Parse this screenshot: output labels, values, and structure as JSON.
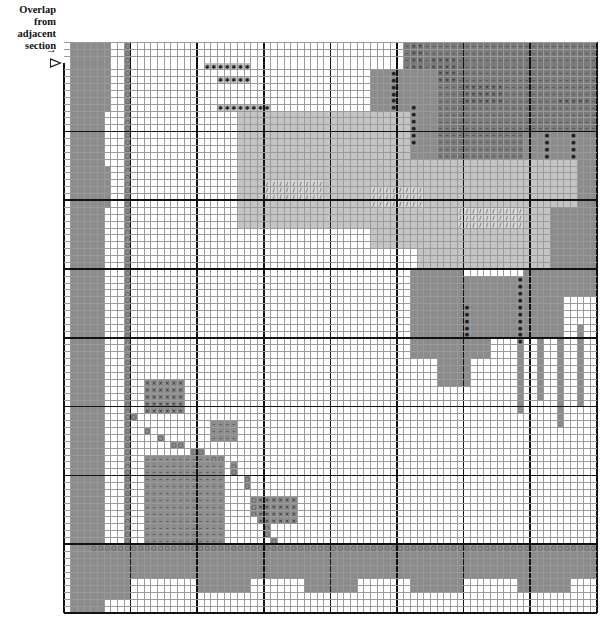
{
  "legend": {
    "line1": "Overlap",
    "line2": "from",
    "line3": "adjacent",
    "line4": "section"
  },
  "markers": {
    "arrow": "→",
    "triangle": "overlap-start-marker"
  },
  "grid": {
    "cols": 80,
    "rows": 83,
    "cell_w": 6.66,
    "cell_h": 6.88,
    "major_every": 10,
    "col_offset": 0,
    "row_offset": 3,
    "overlap_rows": 3
  },
  "colors": {
    "grid_line": "#9a9a9a",
    "major_line": "#111111",
    "mid_gray": "#8c8c8c",
    "dark_gray": "#7a7a7a",
    "light_gray": "#c4c4c4",
    "pale_gray": "#d8d8d8",
    "black_dot": "#111111"
  },
  "symbols": {
    "circle": "○",
    "cross": "×",
    "dot": "●",
    "star": "✱",
    "slash": "/",
    "dash": "–",
    "plus": "+"
  },
  "regions": [
    {
      "name": "left-border-band",
      "color": "mid_gray",
      "rects": [
        [
          1,
          0,
          5,
          83
        ],
        [
          5,
          0,
          2,
          10
        ],
        [
          4,
          18,
          3,
          6
        ],
        [
          2,
          10,
          3,
          3
        ]
      ]
    },
    {
      "name": "left-border-circles",
      "color": "mid_gray",
      "symbol": "circle",
      "rects": [
        [
          9,
          0,
          1,
          80
        ]
      ]
    },
    {
      "name": "bottom-border-band",
      "color": "mid_gray",
      "rects": [
        [
          4,
          73,
          76,
          5
        ],
        [
          2,
          75,
          8,
          6
        ],
        [
          20,
          76,
          8,
          4
        ],
        [
          36,
          76,
          8,
          4
        ],
        [
          52,
          76,
          8,
          4
        ],
        [
          68,
          76,
          8,
          4
        ]
      ]
    },
    {
      "name": "bottom-border-circles",
      "color": "mid_gray",
      "symbol": "circle",
      "rects": [
        [
          4,
          73,
          76,
          1
        ]
      ]
    },
    {
      "name": "bird-head-top",
      "color": "dark_gray",
      "symbol": "dash",
      "rects": [
        [
          51,
          0,
          29,
          18
        ]
      ]
    },
    {
      "name": "bird-head-crosses",
      "color": "dark_gray",
      "symbol": "cross",
      "rects": [
        [
          52,
          0,
          2,
          4
        ],
        [
          55,
          2,
          4,
          4
        ],
        [
          60,
          6,
          6,
          3
        ],
        [
          74,
          8,
          5,
          1
        ]
      ]
    },
    {
      "name": "bird-wing-dark",
      "color": "mid_gray",
      "rects": [
        [
          46,
          4,
          10,
          20
        ],
        [
          43,
          10,
          6,
          12
        ],
        [
          69,
          13,
          11,
          24
        ],
        [
          58,
          34,
          6,
          12
        ],
        [
          63,
          34,
          12,
          9
        ],
        [
          52,
          33,
          8,
          13
        ]
      ]
    },
    {
      "name": "bird-wing-dots",
      "color": "mid_gray",
      "symbol": "dot",
      "rects": [
        [
          49,
          4,
          1,
          16
        ],
        [
          52,
          9,
          1,
          6
        ],
        [
          72,
          13,
          1,
          9
        ],
        [
          76,
          13,
          1,
          6
        ],
        [
          60,
          38,
          1,
          9
        ],
        [
          68,
          34,
          1,
          14
        ]
      ]
    },
    {
      "name": "bird-body-light",
      "color": "light_gray",
      "rects": [
        [
          26,
          10,
          26,
          17
        ],
        [
          36,
          17,
          41,
          7
        ],
        [
          53,
          23,
          20,
          10
        ],
        [
          46,
          24,
          10,
          6
        ]
      ]
    },
    {
      "name": "bird-body-stitches",
      "color": "pale_gray",
      "symbol": "slash",
      "rects": [
        [
          30,
          20,
          9,
          3
        ],
        [
          46,
          21,
          8,
          3
        ],
        [
          59,
          24,
          10,
          3
        ]
      ]
    },
    {
      "name": "bird-beak",
      "color": "light_gray",
      "symbol": "star",
      "rects": [
        [
          21,
          3,
          7,
          1
        ],
        [
          23,
          5,
          5,
          1
        ],
        [
          23,
          9,
          8,
          1
        ]
      ]
    },
    {
      "name": "flower-bud",
      "color": "mid_gray",
      "symbol": "cross",
      "rects": [
        [
          12,
          49,
          6,
          5
        ]
      ]
    },
    {
      "name": "flower-small",
      "color": "mid_gray",
      "symbol": "dash",
      "rects": [
        [
          22,
          55,
          4,
          3
        ]
      ]
    },
    {
      "name": "flower-large",
      "color": "mid_gray",
      "symbol": "dash",
      "rects": [
        [
          12,
          60,
          12,
          13
        ]
      ]
    },
    {
      "name": "flower-heart",
      "color": "mid_gray",
      "symbol": "cross",
      "rects": [
        [
          29,
          66,
          6,
          4
        ]
      ]
    },
    {
      "name": "stem",
      "color": "mid_gray",
      "symbol": "circle",
      "rects": [
        [
          10,
          54,
          1,
          1
        ],
        [
          12,
          56,
          1,
          1
        ],
        [
          14,
          57,
          1,
          1
        ],
        [
          16,
          58,
          2,
          1
        ],
        [
          19,
          59,
          2,
          1
        ],
        [
          22,
          60,
          2,
          1
        ],
        [
          25,
          61,
          1,
          2
        ],
        [
          27,
          63,
          1,
          2
        ],
        [
          28,
          66,
          1,
          3
        ],
        [
          30,
          70,
          1,
          2
        ],
        [
          31,
          72,
          1,
          1
        ]
      ]
    },
    {
      "name": "tail-streaks",
      "color": "mid_gray",
      "rects": [
        [
          56,
          42,
          2,
          8
        ],
        [
          58,
          43,
          3,
          7
        ],
        [
          68,
          44,
          1,
          10
        ],
        [
          74,
          42,
          1,
          14
        ],
        [
          71,
          42,
          1,
          10
        ],
        [
          77,
          41,
          1,
          12
        ]
      ]
    }
  ]
}
